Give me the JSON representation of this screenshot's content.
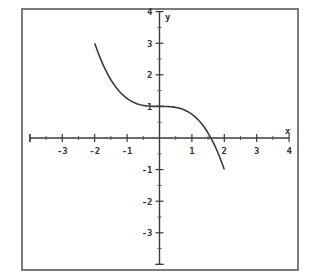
{
  "chart_data": {
    "type": "line",
    "title": "",
    "xlabel": "x",
    "ylabel": "y",
    "xlim": [
      -4,
      4
    ],
    "ylim": [
      -4,
      4
    ],
    "grid": false,
    "legend": null,
    "x_ticks": [
      -3,
      -2,
      -1,
      1,
      2,
      3,
      4
    ],
    "y_ticks": [
      4,
      3,
      2,
      1,
      -1,
      -2,
      -3
    ],
    "x_tick_labels": [
      "-3",
      "-2",
      "-1",
      "1",
      "2",
      "3",
      "4"
    ],
    "y_tick_labels": [
      "4",
      "3",
      "2",
      "1",
      "-1",
      "-2",
      "-3"
    ],
    "minor_tick_step": 0.5,
    "series": [
      {
        "name": "y = 1 - x^3/4",
        "domain": [
          -2,
          2
        ],
        "x": [
          -2,
          -1.5,
          -1,
          -0.5,
          0,
          0.5,
          1,
          1.5,
          1.587,
          2
        ],
        "y": [
          3,
          1.84,
          1.25,
          1.03,
          1,
          0.97,
          0.75,
          0.16,
          0,
          -1
        ]
      }
    ]
  }
}
